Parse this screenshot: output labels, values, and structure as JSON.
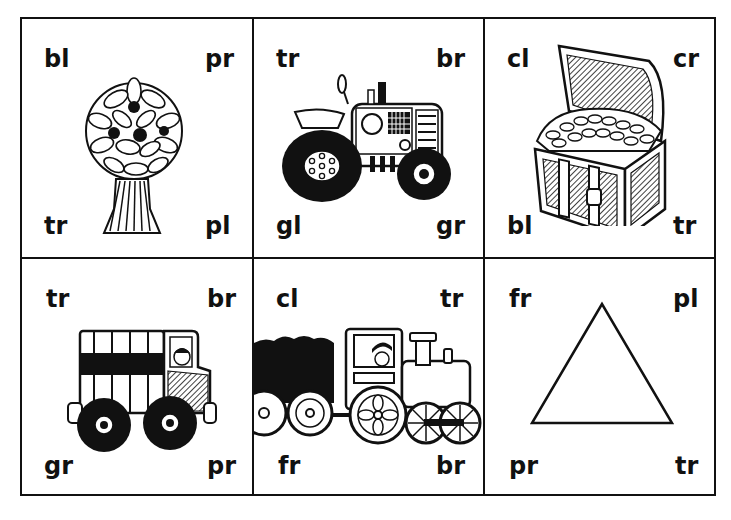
{
  "worksheet": {
    "type": "consonant-blend picture cards",
    "grid": {
      "rows": 2,
      "cols": 3
    },
    "cards": [
      {
        "picture": "tree",
        "labels": {
          "top_left": "bl",
          "top_right": "pr",
          "bottom_left": "tr",
          "bottom_right": "pl"
        }
      },
      {
        "picture": "tractor",
        "labels": {
          "top_left": "tr",
          "top_right": "br",
          "bottom_left": "gl",
          "bottom_right": "gr"
        }
      },
      {
        "picture": "treasure-chest",
        "labels": {
          "top_left": "cl",
          "top_right": "cr",
          "bottom_left": "bl",
          "bottom_right": "tr"
        }
      },
      {
        "picture": "truck",
        "labels": {
          "top_left": "tr",
          "top_right": "br",
          "bottom_left": "gr",
          "bottom_right": "pr"
        }
      },
      {
        "picture": "train",
        "labels": {
          "top_left": "cl",
          "top_right": "tr",
          "bottom_left": "fr",
          "bottom_right": "br"
        }
      },
      {
        "picture": "triangle",
        "labels": {
          "top_left": "fr",
          "top_right": "pl",
          "bottom_left": "pr",
          "bottom_right": "tr"
        }
      }
    ]
  },
  "colors": {
    "ink": "#111111",
    "paper": "#ffffff"
  }
}
